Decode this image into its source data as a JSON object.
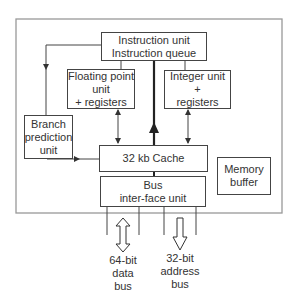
{
  "diagram": {
    "type": "block-diagram",
    "colors": {
      "line": "#444444",
      "frame": "#999999",
      "text": "#333333",
      "background": "#ffffff"
    },
    "blocks": {
      "instruction_unit": {
        "lines": [
          "Instruction unit",
          "Instruction queue"
        ]
      },
      "floating_point": {
        "lines": [
          "Floating point",
          "unit",
          "+ registers"
        ]
      },
      "integer_unit": {
        "lines": [
          "Integer unit",
          "+",
          "registers"
        ]
      },
      "branch_prediction": {
        "lines": [
          "Branch",
          "prediction",
          "unit"
        ]
      },
      "cache": {
        "lines": [
          "32 kb Cache"
        ]
      },
      "bus_interface": {
        "lines": [
          "Bus",
          "inter-face unit"
        ]
      },
      "memory_buffer": {
        "lines": [
          "Memory",
          "buffer"
        ]
      }
    },
    "buses": {
      "data_bus": {
        "lines": [
          "64-bit",
          "data",
          "bus"
        ],
        "direction": "bidirectional"
      },
      "address_bus": {
        "lines": [
          "32-bit",
          "address",
          "bus"
        ],
        "direction": "outbound"
      }
    },
    "connections": [
      {
        "from": "instruction_unit",
        "to": "branch_prediction",
        "arrow": "down"
      },
      {
        "from": "instruction_unit",
        "to": "floating_point",
        "arrow": "none"
      },
      {
        "from": "instruction_unit",
        "to": "integer_unit",
        "arrow": "none"
      },
      {
        "from": "cache",
        "to": "instruction_unit",
        "arrow": "up",
        "style": "thick"
      },
      {
        "from": "floating_point",
        "to": "cache",
        "arrow": "bidirectional"
      },
      {
        "from": "integer_unit",
        "to": "cache",
        "arrow": "bidirectional"
      },
      {
        "from": "branch_prediction",
        "to": "cache",
        "arrow": "right"
      },
      {
        "from": "cache",
        "to": "bus_interface",
        "arrow": "none"
      }
    ]
  }
}
